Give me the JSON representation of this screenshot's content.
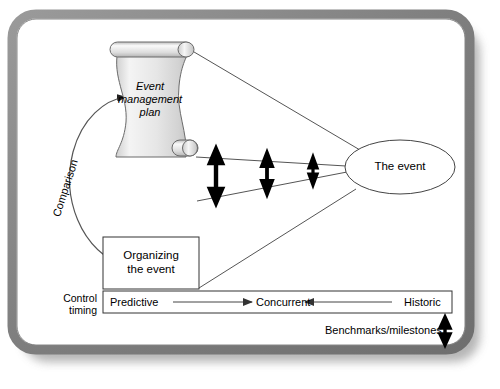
{
  "figure": {
    "kind": "event-management-control-diagram",
    "frame": {
      "style": "rounded grey 3d border with drop shadow"
    }
  },
  "nodes": {
    "plan": {
      "label_lines": [
        "Event",
        "management",
        "plan"
      ],
      "shape": "scroll",
      "style": "italic",
      "fill": "#e8e8e8"
    },
    "event": {
      "label": "The event",
      "shape": "ellipse",
      "fill": "#ffffff"
    },
    "organizing": {
      "label_lines": [
        "Organizing",
        "the event"
      ],
      "shape": "rectangle",
      "fill": "#ffffff"
    }
  },
  "edges": {
    "comparison": {
      "label": "Comparison",
      "shape": "curved-arrow",
      "from": "organizing",
      "to": "plan",
      "rotated": true
    },
    "gap_arrows": {
      "count": 3,
      "description": "double-headed vertical arrows showing converging gap",
      "sizes": [
        "large",
        "medium",
        "small"
      ]
    }
  },
  "timing": {
    "axis_label_lines": [
      "Control",
      "timing"
    ],
    "stages": [
      "Predictive",
      "Concurrent",
      "Historic"
    ],
    "arrows": [
      {
        "from": "Predictive",
        "to": "Concurrent",
        "direction": "right"
      },
      {
        "from": "Historic",
        "to": "Concurrent",
        "direction": "left"
      }
    ]
  },
  "benchmarks": {
    "label": "Benchmarks/milestones",
    "icon": "double-arrow-vertical-icon"
  },
  "colors": {
    "stroke": "#000000",
    "line": "#555555",
    "frame": "#8a8a8a",
    "scroll_fill": "#e9e9e9",
    "scroll_curl": "#f2f2f2"
  }
}
